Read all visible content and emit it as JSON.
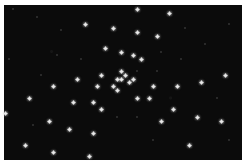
{
  "image": {
    "description": "Star cluster field: white point-like stars on a black sky, framed by a thin white border",
    "background_color": "#0b0b0b",
    "border_color": "#ffffff",
    "star_color": "#f4f4f4",
    "sky_rect": {
      "x": 4,
      "y": 5,
      "width": 238,
      "height": 155
    }
  },
  "stars": [
    {
      "x": 137,
      "y": 9
    },
    {
      "x": 169,
      "y": 13
    },
    {
      "x": 85,
      "y": 24
    },
    {
      "x": 113,
      "y": 28
    },
    {
      "x": 137,
      "y": 32
    },
    {
      "x": 157,
      "y": 36
    },
    {
      "x": 105,
      "y": 48
    },
    {
      "x": 121,
      "y": 52
    },
    {
      "x": 133,
      "y": 55
    },
    {
      "x": 141,
      "y": 59
    },
    {
      "x": 225,
      "y": 75
    },
    {
      "x": 101,
      "y": 75
    },
    {
      "x": 121,
      "y": 71
    },
    {
      "x": 125,
      "y": 75
    },
    {
      "x": 117,
      "y": 79
    },
    {
      "x": 121,
      "y": 79
    },
    {
      "x": 133,
      "y": 79
    },
    {
      "x": 129,
      "y": 82
    },
    {
      "x": 77,
      "y": 79
    },
    {
      "x": 53,
      "y": 86
    },
    {
      "x": 97,
      "y": 86
    },
    {
      "x": 113,
      "y": 86
    },
    {
      "x": 117,
      "y": 90
    },
    {
      "x": 153,
      "y": 86
    },
    {
      "x": 177,
      "y": 86
    },
    {
      "x": 201,
      "y": 82
    },
    {
      "x": 29,
      "y": 98
    },
    {
      "x": 73,
      "y": 102
    },
    {
      "x": 93,
      "y": 102
    },
    {
      "x": 137,
      "y": 98
    },
    {
      "x": 149,
      "y": 98
    },
    {
      "x": 101,
      "y": 109
    },
    {
      "x": 173,
      "y": 109
    },
    {
      "x": 5,
      "y": 113
    },
    {
      "x": 49,
      "y": 121
    },
    {
      "x": 161,
      "y": 121
    },
    {
      "x": 197,
      "y": 117
    },
    {
      "x": 221,
      "y": 121
    },
    {
      "x": 69,
      "y": 129
    },
    {
      "x": 93,
      "y": 133
    },
    {
      "x": 25,
      "y": 145
    },
    {
      "x": 189,
      "y": 145
    },
    {
      "x": 53,
      "y": 152
    },
    {
      "x": 89,
      "y": 156
    }
  ],
  "faint_stars": [
    {
      "x": 13,
      "y": 9
    },
    {
      "x": 37,
      "y": 17
    },
    {
      "x": 61,
      "y": 30
    },
    {
      "x": 185,
      "y": 28
    },
    {
      "x": 229,
      "y": 24
    },
    {
      "x": 57,
      "y": 55
    },
    {
      "x": 81,
      "y": 59
    },
    {
      "x": 161,
      "y": 52
    },
    {
      "x": 205,
      "y": 44
    },
    {
      "x": 181,
      "y": 59
    },
    {
      "x": 9,
      "y": 59
    },
    {
      "x": 137,
      "y": 71
    },
    {
      "x": 157,
      "y": 71
    },
    {
      "x": 117,
      "y": 117
    },
    {
      "x": 137,
      "y": 117
    },
    {
      "x": 41,
      "y": 75
    },
    {
      "x": 217,
      "y": 98
    },
    {
      "x": 153,
      "y": 140
    },
    {
      "x": 33,
      "y": 125
    },
    {
      "x": 229,
      "y": 140
    }
  ]
}
